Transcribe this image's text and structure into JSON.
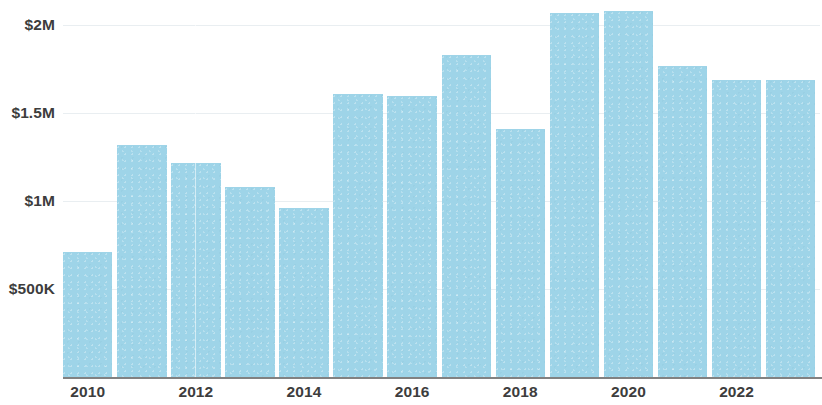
{
  "chart_data": {
    "type": "bar",
    "title": "",
    "subtitle": "",
    "xlabel": "",
    "ylabel": "",
    "categories": [
      "2010",
      "2011",
      "2012",
      "2013",
      "2014",
      "2015",
      "2016",
      "2017",
      "2018",
      "2019",
      "2020",
      "2021",
      "2022",
      "2023"
    ],
    "values": [
      710000,
      1320000,
      1220000,
      1080000,
      960000,
      1610000,
      1600000,
      1830000,
      1410000,
      2070000,
      2080000,
      1770000,
      1690000,
      1690000
    ],
    "x_tick_labels": [
      "2010",
      "2012",
      "2014",
      "2016",
      "2018",
      "2020",
      "2022"
    ],
    "x_tick_categories": [
      "2010",
      "2012",
      "2014",
      "2016",
      "2018",
      "2020",
      "2022"
    ],
    "y_tick_labels": [
      "$2M",
      "$1.5M",
      "$1M",
      "$500K"
    ],
    "y_tick_values": [
      2000000,
      1500000,
      1000000,
      500000
    ],
    "ylim": [
      0,
      2145000
    ],
    "grid": true,
    "legend": false,
    "legend_position": "none",
    "bar_color": "#9ed4e8",
    "axis_color": "#6b6b6b",
    "grid_color": "#e9eef1",
    "tick_label_color": "#3d3d3d"
  }
}
